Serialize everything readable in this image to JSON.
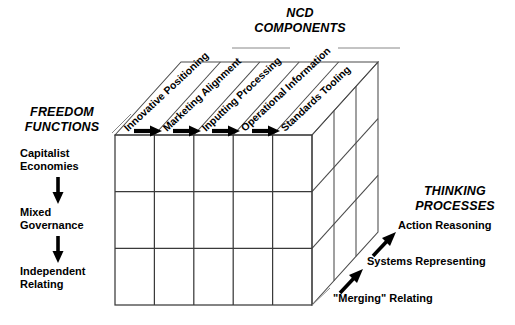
{
  "diagram": {
    "kind": "3d-cube-framework",
    "background_color": "#ffffff",
    "line_color": "#4a4a4a",
    "text_color": "#000000"
  },
  "axes": {
    "top": {
      "title_line1": "NCD",
      "title_line2": "COMPONENTS",
      "labels": [
        "Innovative Positioning",
        "Marketing Alignment",
        "Inputting Processing",
        "Operational Information",
        "Standards Tooling"
      ]
    },
    "left": {
      "title_line1": "FREEDOM",
      "title_line2": "FUNCTIONS",
      "labels": [
        {
          "line1": "Capitalist",
          "line2": "Economies"
        },
        {
          "line1": "Mixed",
          "line2": "Governance"
        },
        {
          "line1": "Independent",
          "line2": "Relating"
        }
      ]
    },
    "right": {
      "title_line1": "THINKING",
      "title_line2": "PROCESSES",
      "labels": [
        "Action Reasoning",
        "Systems Representing",
        "\"Merging\" Relating"
      ]
    }
  },
  "grid": {
    "front_columns": 5,
    "front_rows": 3,
    "depth_slices": 3,
    "top_flow_arrows": 4,
    "left_flow_arrows": 2,
    "right_flow_arrows": 2
  }
}
